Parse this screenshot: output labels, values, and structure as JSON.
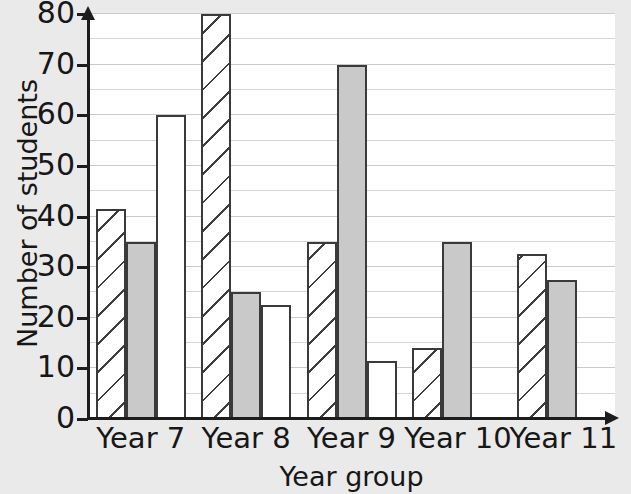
{
  "chart_data": {
    "type": "bar",
    "title": "",
    "xlabel": "Year group",
    "ylabel": "Number of students",
    "categories": [
      "Year 7",
      "Year 8",
      "Year 9",
      "Year 10",
      "Year 11"
    ],
    "series": [
      {
        "name": "hatched",
        "style": "diagonal-hatch",
        "values": [
          41.5,
          80,
          35,
          14,
          32.5
        ]
      },
      {
        "name": "gray",
        "style": "gray-fill",
        "values": [
          35,
          25,
          70,
          35,
          27.5
        ]
      },
      {
        "name": "white",
        "style": "white-fill",
        "values": [
          60,
          22.5,
          11.5,
          null,
          null
        ]
      }
    ],
    "ylim": [
      0,
      80
    ],
    "ytick_labels": [
      "0",
      "10",
      "20",
      "30",
      "40",
      "50",
      "60",
      "70",
      "80"
    ],
    "ytick_values": [
      0,
      10,
      20,
      30,
      40,
      50,
      60,
      70,
      80
    ],
    "minor_gridline_step": 5,
    "grid": true,
    "legend": "none",
    "axis_arrows": true,
    "colors": {
      "gray_fill": "#c9c9c9",
      "bar_outline": "#3a3a3a",
      "gridline": "#d4d4d4",
      "axis": "#1d1d1d",
      "plot_background": "#ffffff",
      "page_background": "#ebeaea",
      "text": "#171717"
    }
  }
}
